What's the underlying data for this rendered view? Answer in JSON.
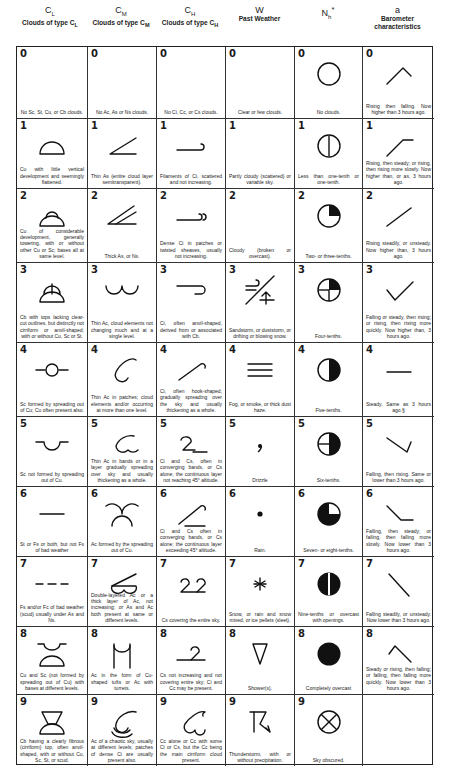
{
  "columns": [
    {
      "code": "C",
      "sub": "L",
      "title": "Clouds of type C",
      "title_sub": "L"
    },
    {
      "code": "C",
      "sub": "M",
      "title": "Clouds of type C",
      "title_sub": "M"
    },
    {
      "code": "C",
      "sub": "H",
      "title": "Clouds of type C",
      "title_sub": "H"
    },
    {
      "code": "W",
      "sub": "",
      "title": "Past Weather",
      "title_sub": ""
    },
    {
      "code": "N",
      "sub": "h",
      "sup": "*",
      "title": "",
      "title_sub": ""
    },
    {
      "code": "a",
      "sub": "",
      "title": "Barometer characteristics",
      "title_sub": ""
    }
  ],
  "rows": [
    {
      "n": "0",
      "cells": [
        {
          "sym": "none",
          "desc": "No Sc, St, Cu, or Cb clouds."
        },
        {
          "sym": "none",
          "desc": "No Ac, As or Ns clouds."
        },
        {
          "sym": "none",
          "desc": "No Ci, Cc, or Cs clouds."
        },
        {
          "sym": "none",
          "desc": "Clear or few clouds."
        },
        {
          "sym": "circle-empty",
          "desc": "No clouds."
        },
        {
          "sym": "baro-0",
          "desc": "Rising then falling. Now higher than 3 hours ago."
        }
      ]
    },
    {
      "n": "1",
      "cells": [
        {
          "sym": "cl-1",
          "desc": "Cu with little vertical development and seemingly flattened."
        },
        {
          "sym": "cm-1",
          "desc": "Thin As (entire cloud layer semitransparent)."
        },
        {
          "sym": "ch-1",
          "desc": "Filaments of Ci, scattered and not increasing."
        },
        {
          "sym": "none",
          "desc": "Partly cloudy (scattered) or variable sky."
        },
        {
          "sym": "circle-1",
          "desc": "Less than one-tenth or one-tenth."
        },
        {
          "sym": "baro-1",
          "desc": "Rising, then steady; or rising, then rising more slowly. Now higher than, or as, 3 hours ago."
        }
      ]
    },
    {
      "n": "2",
      "cells": [
        {
          "sym": "cl-2",
          "desc": "Cu of considerable development, generally towering, with or without other Cu or Sc; bases all at same level."
        },
        {
          "sym": "cm-2",
          "desc": "Thick As, or Ns."
        },
        {
          "sym": "ch-2",
          "desc": "Dense Ci in patches or twisted sheaves, usually not increasing."
        },
        {
          "sym": "none",
          "desc": "Cloudy (broken or overcast)."
        },
        {
          "sym": "circle-2",
          "desc": "Two- or three-tenths."
        },
        {
          "sym": "baro-2",
          "desc": "Rising steadily, or unsteady. Now higher than, 3 hours ago."
        }
      ]
    },
    {
      "n": "3",
      "cells": [
        {
          "sym": "cl-3",
          "desc": "Cb with tops lacking clear-cut outlines, but distinctly not cirriform or anvil-shaped; with or without Cu, Sc or St."
        },
        {
          "sym": "cm-3",
          "desc": "Thin Ac, cloud elements not changing much and at a single level."
        },
        {
          "sym": "ch-3",
          "desc": "Ci, often anvil-shaped, derived from or associated with Cb."
        },
        {
          "sym": "w-3",
          "desc": "Sandstorm, or duststorm, or drifting or blowing snow."
        },
        {
          "sym": "circle-3",
          "desc": "Four-tenths."
        },
        {
          "sym": "baro-3",
          "desc": "Falling or steady, then rising; or rising, then rising more quickly. Now higher than, 3 hours ago."
        }
      ]
    },
    {
      "n": "4",
      "cells": [
        {
          "sym": "cl-4",
          "desc": "Sc formed by spreading out of Cu; Cu often present also."
        },
        {
          "sym": "cm-4",
          "desc": "Thin Ac in patches; cloud elements and/or occurring at more than one level."
        },
        {
          "sym": "ch-4",
          "desc": "Ci, often hook-shaped, gradually spreading over the sky and usually thickening as a whole."
        },
        {
          "sym": "w-4",
          "desc": "Fog, or smoke, or thick dust haze."
        },
        {
          "sym": "circle-4",
          "desc": "Five-tenths."
        },
        {
          "sym": "baro-4",
          "desc": "Steady. Same as 3 hours ago.§"
        }
      ]
    },
    {
      "n": "5",
      "cells": [
        {
          "sym": "cl-5",
          "desc": "Sc not formed by spreading out of Cu."
        },
        {
          "sym": "cm-5",
          "desc": "Thin Ac in bands or in a layer gradually spreading over sky and usually thickening as a whole."
        },
        {
          "sym": "ch-5",
          "desc": "Ci and Cs, often in converging bands, or Cs alone; the continuous layer not reaching 45° altitude."
        },
        {
          "sym": "w-5",
          "desc": "Drizzle"
        },
        {
          "sym": "circle-5",
          "desc": "Six-tenths."
        },
        {
          "sym": "baro-5",
          "desc": "Falling, then rising. Same or lower than 3 hours ago."
        }
      ]
    },
    {
      "n": "6",
      "cells": [
        {
          "sym": "cl-6",
          "desc": "St or Fs or both, but not Fs of bad weather"
        },
        {
          "sym": "cm-6",
          "desc": "Ac formed by the spreading out of Cu."
        },
        {
          "sym": "ch-6",
          "desc": "Ci and Cs often in converging bands, or Cs alone; the continuous layer exceeding 45° altitude."
        },
        {
          "sym": "w-6",
          "desc": "Rain."
        },
        {
          "sym": "circle-6",
          "desc": "Seven- or eight-tenths."
        },
        {
          "sym": "baro-6",
          "desc": "Falling, then steady; or falling, then falling more slowly. Now lower than 3 hours ago."
        }
      ]
    },
    {
      "n": "7",
      "cells": [
        {
          "sym": "cl-7",
          "desc": "Fs and/or Fc of bad weather (scud) usually under As and Ns."
        },
        {
          "sym": "cm-7",
          "desc": "Double-layered Ac or a thick layer of Ac, not increasing; or As and Ac both present at same or different levels."
        },
        {
          "sym": "ch-7",
          "desc": "Cs covering the entire sky."
        },
        {
          "sym": "w-7",
          "desc": "Snow, or rain and snow mixed, or ice pellets (sleet)."
        },
        {
          "sym": "circle-7",
          "desc": "Nine-tenths or overcast with openings."
        },
        {
          "sym": "baro-7",
          "desc": "Falling steadily, or unsteady. Now lower than 3 hours ago."
        }
      ]
    },
    {
      "n": "8",
      "cells": [
        {
          "sym": "cl-8",
          "desc": "Cu and Sc (not formed by spreading out of Cu) with bases at different levels."
        },
        {
          "sym": "cm-8",
          "desc": "Ac in the form of Cu-shaped tufts or Ac with turrets."
        },
        {
          "sym": "ch-8",
          "desc": "Cs not increasing and not covering entire sky; Ci and Cc may be present."
        },
        {
          "sym": "w-8",
          "desc": "Shower(s)."
        },
        {
          "sym": "circle-8",
          "desc": "Completely overcast"
        },
        {
          "sym": "baro-8",
          "desc": "Steady or rising, then falling; or falling, then falling more quickly. Now lower than 3 hours ago."
        }
      ]
    },
    {
      "n": "9",
      "cells": [
        {
          "sym": "cl-9",
          "desc": "Cb having a clearly fibrous (cirriform) top, often anvil-shaped, with or without Cu, Sc, St, or scud."
        },
        {
          "sym": "cm-9",
          "desc": "Ac of a chaotic sky, usually at different levels; patches of dense Ci are usually present also."
        },
        {
          "sym": "ch-9",
          "desc": "Cc alone or Cc with some Ci or Cs, but the Cc being the main cirriform cloud present."
        },
        {
          "sym": "w-9",
          "desc": "Thunderstorm, with or without precipitation."
        },
        {
          "sym": "circle-9",
          "desc": "Sky obscured."
        },
        {
          "sym": "empty",
          "desc": "",
          "no_number": true
        }
      ]
    }
  ]
}
